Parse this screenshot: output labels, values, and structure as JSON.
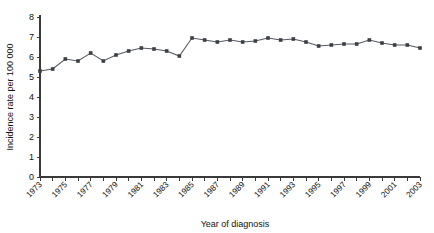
{
  "chart_data": {
    "type": "line",
    "title": "",
    "xlabel": "Year of diagnosis",
    "ylabel": "Incidence rate per 100 000",
    "xlim": [
      1972.5,
      2003.5
    ],
    "ylim": [
      0,
      8
    ],
    "yticks": [
      0,
      1,
      2,
      3,
      4,
      5,
      6,
      7,
      8
    ],
    "ytick_labels": [
      "0",
      "1",
      "2",
      "3",
      "4",
      "5",
      "6",
      "7",
      "8"
    ],
    "xticks": [
      1973,
      1974,
      1975,
      1976,
      1977,
      1978,
      1979,
      1980,
      1981,
      1982,
      1983,
      1984,
      1985,
      1986,
      1987,
      1988,
      1989,
      1990,
      1991,
      1992,
      1993,
      1994,
      1995,
      1996,
      1997,
      1998,
      1999,
      2000,
      2001,
      2002,
      2003
    ],
    "xtick_labels_shown": [
      "1973",
      "1975",
      "1977",
      "1979",
      "1981",
      "1983",
      "1985",
      "1987",
      "1989",
      "1991",
      "1993",
      "1995",
      "1997",
      "1999",
      "2001",
      "2003"
    ],
    "grid": false,
    "legend": "none",
    "marker": "square",
    "line_color": "#555a60",
    "marker_color": "#3b3f45",
    "x": [
      1973,
      1974,
      1975,
      1976,
      1977,
      1978,
      1979,
      1980,
      1981,
      1982,
      1983,
      1984,
      1985,
      1986,
      1987,
      1988,
      1989,
      1990,
      1991,
      1992,
      1993,
      1994,
      1995,
      1996,
      1997,
      1998,
      1999,
      2000,
      2001,
      2002,
      2003
    ],
    "values": [
      5.3,
      5.4,
      5.9,
      5.8,
      6.2,
      5.8,
      6.1,
      6.3,
      6.45,
      6.4,
      6.3,
      6.05,
      6.95,
      6.85,
      6.75,
      6.85,
      6.75,
      6.8,
      6.95,
      6.85,
      6.9,
      6.75,
      6.55,
      6.6,
      6.65,
      6.65,
      6.85,
      6.7,
      6.6,
      6.6,
      6.45
    ],
    "series": [
      {
        "name": "Incidence rate",
        "values": [
          5.3,
          5.4,
          5.9,
          5.8,
          6.2,
          5.8,
          6.1,
          6.3,
          6.45,
          6.4,
          6.3,
          6.05,
          6.95,
          6.85,
          6.75,
          6.85,
          6.75,
          6.8,
          6.95,
          6.85,
          6.9,
          6.75,
          6.55,
          6.6,
          6.65,
          6.65,
          6.85,
          6.7,
          6.6,
          6.6,
          6.45
        ]
      }
    ]
  }
}
